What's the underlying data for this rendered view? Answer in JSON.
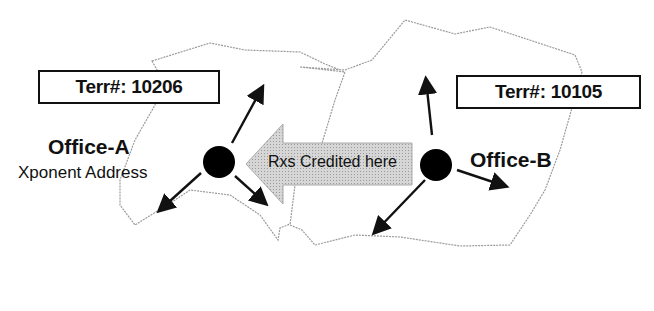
{
  "diagram": {
    "territories": [
      {
        "id": "A",
        "label": "Terr#: 10206"
      },
      {
        "id": "B",
        "label": "Terr#: 10105"
      }
    ],
    "offices": [
      {
        "id": "A",
        "name": "Office-A",
        "subtitle": "Xponent Address"
      },
      {
        "id": "B",
        "name": "Office-B"
      }
    ],
    "credit_arrow": {
      "label": "Rxs Credited here",
      "direction": "left",
      "from": "Office-B",
      "to": "Office-A"
    },
    "colors": {
      "ink": "#111111",
      "border": "#9a9a9a",
      "arrow_fill": "#cfcfcf"
    }
  }
}
